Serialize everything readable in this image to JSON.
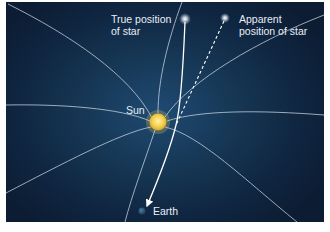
{
  "diagram": {
    "labels": {
      "true_star_line1": "True position",
      "true_star_line2": "of star",
      "apparent_star_line1": "Apparent",
      "apparent_star_line2": "position of star",
      "sun": "Sun",
      "earth": "Earth"
    },
    "colors": {
      "background_center": "#1f4a72",
      "background_edge": "#0c1d33",
      "field_lines": "#c8d4e0",
      "sun": "#f2c84a",
      "earth": "#2f5b80",
      "light_ray": "#ffffff"
    },
    "elements": {
      "sun": {
        "x": 158,
        "y": 122,
        "r": 9
      },
      "true_star": {
        "x": 185,
        "y": 19
      },
      "apparent_star": {
        "x": 225,
        "y": 18
      },
      "earth": {
        "x": 142,
        "y": 211
      }
    }
  }
}
